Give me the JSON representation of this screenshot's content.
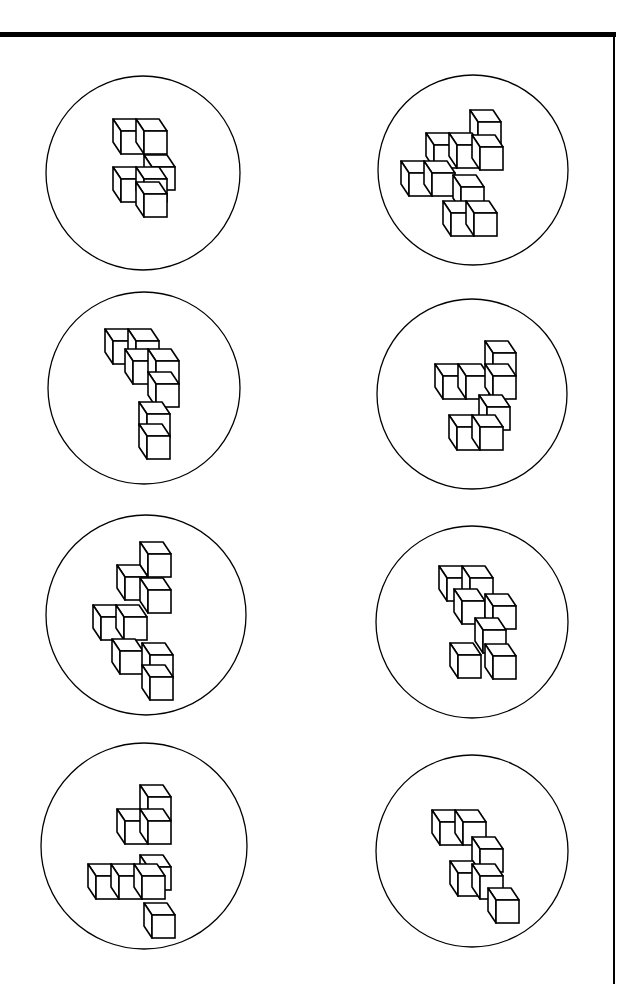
{
  "page": {
    "width": 617,
    "height": 984,
    "border_color": "#000000",
    "stroke_color": "#000000",
    "background": "#ffffff"
  },
  "cube": {
    "size": 23,
    "depth_dx": -8,
    "depth_dy": -12
  },
  "figures": [
    {
      "id": "fig-1",
      "circle": {
        "cx": 143,
        "cy": 173,
        "r": 97
      },
      "cubes": [
        [
          121,
          131
        ],
        [
          144,
          131
        ],
        [
          121,
          179
        ],
        [
          144,
          179
        ],
        [
          144,
          194
        ],
        [
          152,
          167
        ]
      ]
    },
    {
      "id": "fig-2",
      "circle": {
        "cx": 473,
        "cy": 170,
        "r": 95
      },
      "cubes": [
        [
          478,
          122
        ],
        [
          434,
          145
        ],
        [
          457,
          145
        ],
        [
          480,
          147
        ],
        [
          409,
          173
        ],
        [
          432,
          173
        ],
        [
          461,
          187
        ],
        [
          451,
          213
        ],
        [
          474,
          213
        ]
      ]
    },
    {
      "id": "fig-3",
      "circle": {
        "cx": 144,
        "cy": 388,
        "r": 96
      },
      "cubes": [
        [
          113,
          341
        ],
        [
          136,
          341
        ],
        [
          133,
          361
        ],
        [
          156,
          361
        ],
        [
          156,
          384
        ],
        [
          147,
          414
        ],
        [
          147,
          436
        ]
      ]
    },
    {
      "id": "fig-4",
      "circle": {
        "cx": 472,
        "cy": 394,
        "r": 95
      },
      "cubes": [
        [
          443,
          376
        ],
        [
          466,
          376
        ],
        [
          493,
          353
        ],
        [
          493,
          376
        ],
        [
          487,
          407
        ],
        [
          457,
          427
        ],
        [
          480,
          427
        ]
      ]
    },
    {
      "id": "fig-5",
      "circle": {
        "cx": 146,
        "cy": 615,
        "r": 100
      },
      "cubes": [
        [
          148,
          554
        ],
        [
          125,
          577
        ],
        [
          148,
          590
        ],
        [
          101,
          617
        ],
        [
          124,
          617
        ],
        [
          120,
          651
        ],
        [
          150,
          655
        ],
        [
          150,
          677
        ]
      ]
    },
    {
      "id": "fig-6",
      "circle": {
        "cx": 472,
        "cy": 622,
        "r": 96
      },
      "cubes": [
        [
          447,
          578
        ],
        [
          470,
          578
        ],
        [
          493,
          606
        ],
        [
          462,
          601
        ],
        [
          458,
          655
        ],
        [
          493,
          656
        ],
        [
          483,
          630
        ]
      ]
    },
    {
      "id": "fig-7",
      "circle": {
        "cx": 144,
        "cy": 846,
        "r": 103
      },
      "cubes": [
        [
          148,
          797
        ],
        [
          125,
          821
        ],
        [
          148,
          821
        ],
        [
          148,
          867
        ],
        [
          96,
          876
        ],
        [
          119,
          876
        ],
        [
          142,
          876
        ],
        [
          152,
          915
        ]
      ]
    },
    {
      "id": "fig-8",
      "circle": {
        "cx": 472,
        "cy": 851,
        "r": 96
      },
      "cubes": [
        [
          440,
          822
        ],
        [
          463,
          822
        ],
        [
          480,
          849
        ],
        [
          458,
          873
        ],
        [
          480,
          876
        ],
        [
          496,
          900
        ]
      ]
    }
  ]
}
